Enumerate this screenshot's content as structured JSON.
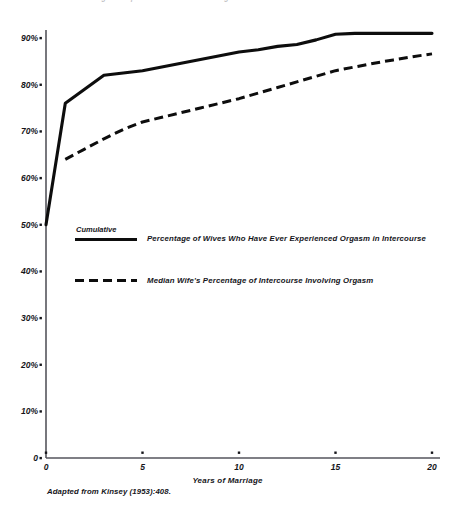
{
  "figure": {
    "title": "FIGURE 9.2  Orgasm Experience of Wives in Marriage",
    "source_note": "Adapted from Kinsey (1953):408."
  },
  "legend": {
    "kicker": "Cumulative",
    "entries": [
      {
        "style": "solid",
        "label": "Percentage of Wives Who Have Ever Experienced Orgasm in Intercourse"
      },
      {
        "style": "dashed",
        "label": "Median Wife's Percentage of Intercourse Involving Orgasm"
      }
    ]
  },
  "chart_data": {
    "type": "line",
    "title": "FIGURE 9.2  Orgasm Experience of Wives in Marriage",
    "xlabel": "Years of Marriage",
    "ylabel": "",
    "xlim": [
      0,
      20
    ],
    "ylim": [
      0,
      95
    ],
    "grid": false,
    "legend_position": "inside-center-left",
    "xticks": [
      0,
      5,
      10,
      15,
      20
    ],
    "xtick_labels": [
      "0",
      "5",
      "10",
      "15",
      "20"
    ],
    "yticks": [
      0,
      10,
      20,
      30,
      40,
      50,
      60,
      70,
      80,
      90
    ],
    "ytick_labels": [
      "0",
      "10%",
      "20%",
      "30%",
      "40%",
      "50%",
      "60%",
      "70%",
      "80%",
      "90%"
    ],
    "series": [
      {
        "name": "Cumulative Percentage of Wives Who Have Ever Experienced Orgasm in Intercourse",
        "style": "solid",
        "color": "#0d0d0d",
        "x": [
          0,
          1,
          2,
          3,
          4,
          5,
          6,
          7,
          8,
          9,
          10,
          11,
          12,
          13,
          14,
          15,
          16,
          17,
          18,
          19,
          20
        ],
        "values": [
          50,
          76,
          79,
          82,
          82.5,
          83,
          83.8,
          84.6,
          85.4,
          86.2,
          87,
          87.5,
          88.2,
          88.6,
          89.6,
          90.8,
          91,
          91,
          91,
          91,
          91
        ]
      },
      {
        "name": "Median Wife's Percentage of Intercourse Involving Orgasm",
        "style": "dashed",
        "color": "#0d0d0d",
        "x": [
          1,
          2,
          3,
          4,
          5,
          6,
          7,
          8,
          9,
          10,
          11,
          12,
          13,
          14,
          15,
          16,
          17,
          18,
          19,
          20
        ],
        "values": [
          64,
          66.2,
          68.4,
          70.4,
          72,
          73,
          74,
          75,
          76,
          77,
          78.2,
          79.4,
          80.6,
          81.8,
          83,
          83.8,
          84.6,
          85.3,
          86,
          86.6
        ]
      }
    ]
  },
  "axes": {
    "x_title": "Years of Marriage"
  },
  "colors": {
    "ink": "#0d0d0d",
    "axis": "#55555c",
    "background": "#ffffff"
  }
}
